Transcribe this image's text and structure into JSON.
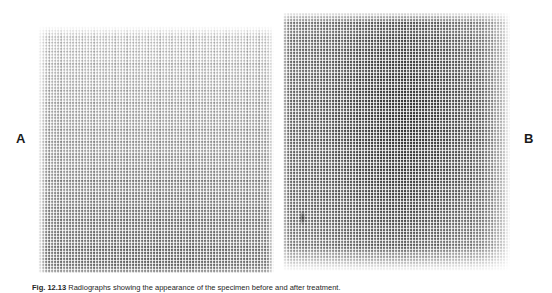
{
  "figure": {
    "background_color": "#ffffff",
    "panels": [
      {
        "id": "A",
        "label": "A",
        "label_position": "left",
        "description": "halftone-screened radiograph, light at top fading to dark gray at bottom",
        "tone_light": "#f3f3f3",
        "tone_dark": "#9d9d9d"
      },
      {
        "id": "B",
        "label": "B",
        "label_position": "right",
        "description": "halftone-screened radiograph with dark vertical band through the centre, lightening toward the right edge and bottom",
        "tone_light": "#ededed",
        "tone_dark": "#8c8c8c"
      }
    ],
    "caption": {
      "label": "Fig. 12.13",
      "separator": "  ",
      "text": "Radiographs showing the appearance of the specimen before and after treatment.",
      "clipped": true
    }
  }
}
